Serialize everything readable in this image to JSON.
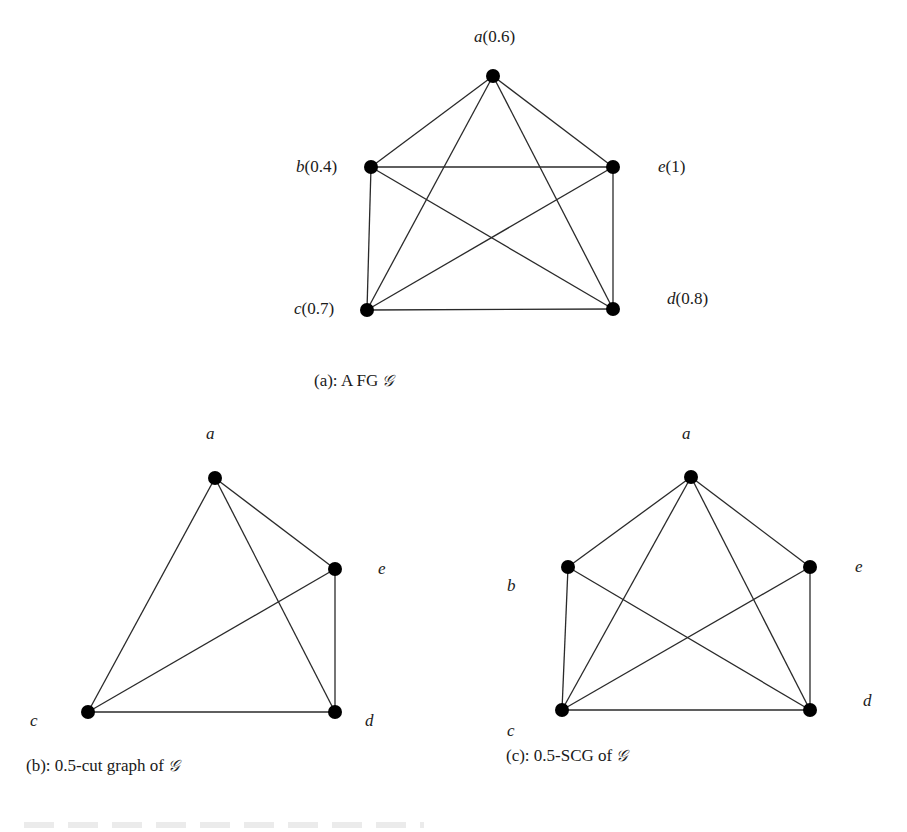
{
  "figure": {
    "graphs": [
      {
        "id": "a",
        "caption": {
          "prefix": "(a): A  FG ",
          "symbol": "𝒢"
        },
        "nodes": [
          {
            "name": "a",
            "value": "0.6",
            "label": "a(0.6)",
            "x": 493,
            "y": 76,
            "lx": 474,
            "ly": 28
          },
          {
            "name": "b",
            "value": "0.4",
            "label": "b(0.4)",
            "x": 371,
            "y": 167,
            "lx": 296,
            "ly": 158
          },
          {
            "name": "e",
            "value": "1",
            "label": "e(1)",
            "x": 613,
            "y": 167,
            "lx": 658,
            "ly": 158
          },
          {
            "name": "c",
            "value": "0.7",
            "label": "c(0.7)",
            "x": 367,
            "y": 310,
            "lx": 294,
            "ly": 300
          },
          {
            "name": "d",
            "value": "0.8",
            "label": "d(0.8)",
            "x": 613,
            "y": 309,
            "lx": 667,
            "ly": 290
          }
        ],
        "edges": [
          [
            "a",
            "b"
          ],
          [
            "a",
            "e"
          ],
          [
            "a",
            "c"
          ],
          [
            "a",
            "d"
          ],
          [
            "b",
            "e"
          ],
          [
            "b",
            "c"
          ],
          [
            "b",
            "d"
          ],
          [
            "e",
            "c"
          ],
          [
            "e",
            "d"
          ],
          [
            "c",
            "d"
          ]
        ],
        "caption_pos": {
          "x": 314,
          "y": 372
        }
      },
      {
        "id": "b",
        "caption": {
          "prefix": "(b): 0.5-cut graph of ",
          "symbol": "𝒢"
        },
        "nodes": [
          {
            "name": "a",
            "label": "a",
            "x": 215,
            "y": 478,
            "lx": 206,
            "ly": 425
          },
          {
            "name": "e",
            "label": "e",
            "x": 335,
            "y": 569,
            "lx": 378,
            "ly": 560
          },
          {
            "name": "c",
            "label": "c",
            "x": 88,
            "y": 712,
            "lx": 30,
            "ly": 712
          },
          {
            "name": "d",
            "label": "d",
            "x": 335,
            "y": 712,
            "lx": 365,
            "ly": 712
          }
        ],
        "edges": [
          [
            "a",
            "e"
          ],
          [
            "a",
            "c"
          ],
          [
            "a",
            "d"
          ],
          [
            "e",
            "c"
          ],
          [
            "e",
            "d"
          ],
          [
            "c",
            "d"
          ]
        ],
        "caption_pos": {
          "x": 26,
          "y": 757
        }
      },
      {
        "id": "c",
        "caption": {
          "prefix": "(c): 0.5-SCG of ",
          "symbol": "𝒢"
        },
        "nodes": [
          {
            "name": "a",
            "label": "a",
            "x": 691,
            "y": 477,
            "lx": 682,
            "ly": 425
          },
          {
            "name": "b",
            "label": "b",
            "x": 568,
            "y": 567,
            "lx": 507,
            "ly": 577
          },
          {
            "name": "e",
            "label": "e",
            "x": 810,
            "y": 567,
            "lx": 855,
            "ly": 558
          },
          {
            "name": "c",
            "label": "c",
            "x": 562,
            "y": 710,
            "lx": 507,
            "ly": 722
          },
          {
            "name": "d",
            "label": "d",
            "x": 810,
            "y": 710,
            "lx": 863,
            "ly": 692
          }
        ],
        "edges": [
          [
            "a",
            "b"
          ],
          [
            "a",
            "e"
          ],
          [
            "a",
            "c"
          ],
          [
            "a",
            "d"
          ],
          [
            "b",
            "c"
          ],
          [
            "b",
            "d"
          ],
          [
            "e",
            "c"
          ],
          [
            "e",
            "d"
          ],
          [
            "c",
            "d"
          ]
        ],
        "caption_pos": {
          "x": 506,
          "y": 747
        }
      }
    ],
    "style": {
      "edge_color": "#2a2a2a",
      "node_color": "#000000",
      "node_radius": 7,
      "edge_width": 1.3
    }
  }
}
